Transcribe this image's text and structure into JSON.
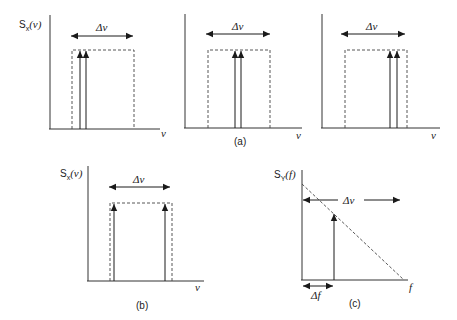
{
  "figure": {
    "panels": [
      {
        "id": "a1",
        "ylabel": "Sₓ(ν)",
        "xlabel": "ν",
        "bandwidth_label": "Δν",
        "description": "Two closely spaced spectral lines near left edge of Δν band"
      },
      {
        "id": "a2",
        "xlabel": "ν",
        "bandwidth_label": "Δν",
        "caption": "(a)",
        "description": "Two closely spaced spectral lines near center of Δν band"
      },
      {
        "id": "a3",
        "xlabel": "ν",
        "bandwidth_label": "Δν",
        "description": "Two closely spaced spectral lines near right edge of Δν band"
      },
      {
        "id": "b",
        "ylabel": "Sₓ(ν)",
        "xlabel": "ν",
        "bandwidth_label": "Δν",
        "caption": "(b)",
        "description": "Two spectral lines at both edges of Δν band"
      },
      {
        "id": "c",
        "ylabel": "S_Y(f)",
        "ylabel_main": "S",
        "ylabel_sub": "Y",
        "ylabel_arg": "(f)",
        "xlabel": "f",
        "bandwidth_label": "Δν",
        "beat_label": "Δf",
        "caption": "(c)",
        "description": "Beat-note spectrum with triangular (dashed) continuum and a single line at Δf"
      }
    ],
    "labels": {
      "sx_main": "S",
      "sx_sub": "x",
      "sx_arg": "(ν)",
      "nu": "ν",
      "delta_nu": "Δν",
      "delta_f": "Δf",
      "f": "f",
      "cap_a": "(a)",
      "cap_b": "(b)",
      "cap_c": "(c)"
    }
  }
}
